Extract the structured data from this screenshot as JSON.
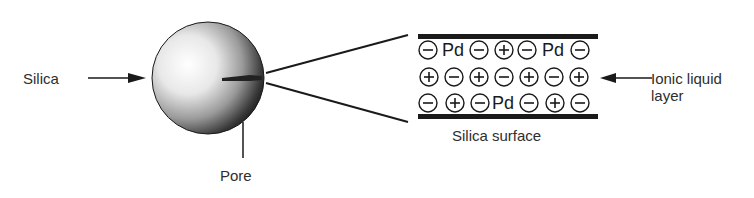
{
  "labels": {
    "silica": "Silica",
    "pore": "Pore",
    "ionic_liquid_line1": "Ionic liquid",
    "ionic_liquid_line2": "layer",
    "silica_surface": "Silica surface"
  },
  "layer": {
    "rows": [
      [
        "-",
        "Pd",
        "-",
        "+",
        "-",
        "Pd",
        "-"
      ],
      [
        "+",
        "-",
        "+",
        "-",
        "+",
        "-",
        "+"
      ],
      [
        "-",
        "+",
        "-",
        "Pd",
        "-",
        "+",
        "-"
      ]
    ],
    "symbols": {
      "minus": "−",
      "plus": "+",
      "palladium": "Pd"
    }
  },
  "colors": {
    "ink": "#1a1a1a",
    "text": "#2e2e2e",
    "background": "#ffffff"
  }
}
